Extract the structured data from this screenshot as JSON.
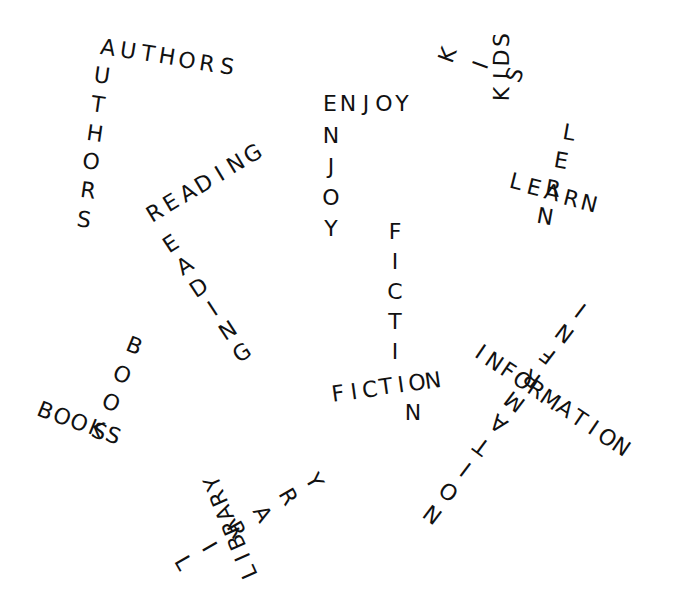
{
  "words": [
    {
      "id": "authors-across",
      "text": "AUTHORS"
    },
    {
      "id": "authors-down",
      "text": "UTHORS"
    },
    {
      "id": "reading-across",
      "text": "READING"
    },
    {
      "id": "reading-down",
      "text": "EADING"
    },
    {
      "id": "enjoy-across",
      "text": "ENJOY"
    },
    {
      "id": "enjoy-down",
      "text": "NJOY"
    },
    {
      "id": "kids-vertical",
      "text": "KIDS"
    },
    {
      "id": "kids-diagonal",
      "text": "KIS"
    },
    {
      "id": "learn-across",
      "text": "LEARN"
    },
    {
      "id": "learn-down",
      "text": "LERN"
    },
    {
      "id": "fiction-down",
      "text": "FICTI"
    },
    {
      "id": "fiction-across",
      "text": "FICTION"
    },
    {
      "id": "fiction-tail",
      "text": "N"
    },
    {
      "id": "information-across",
      "text": "INFORMATION"
    },
    {
      "id": "information-diagonal",
      "text": "INFRMATION"
    },
    {
      "id": "books-across",
      "text": "BOOKS"
    },
    {
      "id": "books-diagonal",
      "text": "BOOS"
    },
    {
      "id": "library-upside",
      "text": "LIBRARY"
    },
    {
      "id": "library-diagonal",
      "text": "LIRARY"
    }
  ]
}
